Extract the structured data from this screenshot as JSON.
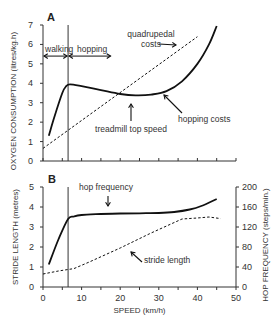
{
  "chart_data": [
    {
      "panel": "A",
      "type": "line",
      "xlabel": "SPEED (km/h)",
      "ylabel": "OXYGEN CONSUMPTION (litres/kg.h)",
      "xlim": [
        0,
        50
      ],
      "ylim": [
        0,
        7
      ],
      "yticks": [
        0,
        1,
        2,
        3,
        4,
        5,
        6,
        7
      ],
      "xticks": [
        0,
        5,
        10,
        15,
        20,
        25,
        30,
        35,
        40,
        45,
        50
      ],
      "grid": false,
      "series": [
        {
          "name": "hopping costs",
          "style": "solid",
          "x": [
            1.5,
            3,
            5,
            6,
            7,
            10,
            15,
            20,
            24,
            28,
            32,
            36,
            40,
            43,
            45
          ],
          "y": [
            1.3,
            2.3,
            3.5,
            3.85,
            3.95,
            3.85,
            3.65,
            3.45,
            3.38,
            3.42,
            3.6,
            4.1,
            5.0,
            6.0,
            6.95
          ]
        },
        {
          "name": "quadrupedal costs",
          "style": "dashed",
          "x": [
            0,
            40
          ],
          "y": [
            0.65,
            6.4
          ]
        }
      ],
      "annotations": [
        {
          "text": "walking",
          "x_range": [
            0,
            6.5
          ],
          "y": 5.4
        },
        {
          "text": "hopping",
          "x_range": [
            6.5,
            17.5
          ],
          "y": 5.4
        },
        {
          "text": "quadrupedal costs",
          "arrow_to": [
            37.5,
            6.0
          ]
        },
        {
          "text": "treadmill top speed",
          "arrow_to": [
            23,
            3.38
          ]
        },
        {
          "text": "hopping costs",
          "arrow_to": [
            33,
            3.6
          ]
        }
      ],
      "vline_x": 6.5
    },
    {
      "panel": "B",
      "type": "line",
      "xlabel": "SPEED (km/h)",
      "ylabel": "STRIDE LENGTH (metres)",
      "y2label": "HOP FREQUENCY (steps/min.)",
      "xlim": [
        0,
        50
      ],
      "ylim": [
        0,
        5
      ],
      "y2lim": [
        0,
        200
      ],
      "xticks": [
        0,
        10,
        20,
        30,
        40,
        50
      ],
      "yticks": [
        0,
        1,
        2,
        3,
        4,
        5
      ],
      "y2ticks": [
        0,
        40,
        80,
        120,
        160,
        200
      ],
      "grid": false,
      "series": [
        {
          "name": "hop frequency",
          "axis": "right",
          "style": "solid",
          "x": [
            1.5,
            4,
            6.5,
            8,
            10,
            15,
            20,
            25,
            30,
            34,
            38,
            41,
            45
          ],
          "y": [
            45,
            95,
            136,
            141,
            144,
            146,
            147,
            147.5,
            148,
            150,
            155,
            162,
            176
          ]
        },
        {
          "name": "stride length",
          "axis": "left",
          "style": "dashed",
          "x": [
            0,
            4,
            8,
            12,
            20,
            28,
            36,
            40,
            43,
            46
          ],
          "y": [
            0.65,
            0.8,
            0.92,
            1.25,
            1.95,
            2.7,
            3.4,
            3.45,
            3.5,
            3.42
          ]
        }
      ],
      "annotations": [
        {
          "text": "hop frequency",
          "arrow_to": [
            17,
            3.68
          ]
        },
        {
          "text": "stride length",
          "arrow_to": [
            23,
            2.25
          ]
        }
      ],
      "vline_x": 6.5
    }
  ],
  "labels": {
    "panel_a": "A",
    "panel_b": "B",
    "xlabel": "SPEED (km/h)",
    "ylabel_a": "OXYGEN CONSUMPTION (litres/kg.h)",
    "ylabel_b": "STRIDE LENGTH (metres)",
    "y2label_b": "HOP FREQUENCY (steps/min.)",
    "walking": "walking",
    "hopping": "hopping",
    "quad1": "quadrupedal",
    "quad2": "costs",
    "treadmill": "treadmill top speed",
    "hopping_costs": "hopping costs",
    "hop_frequency": "hop frequency",
    "stride_length": "stride length"
  },
  "colors": {
    "line": "#111111",
    "axis": "#333333",
    "text": "#333333"
  }
}
